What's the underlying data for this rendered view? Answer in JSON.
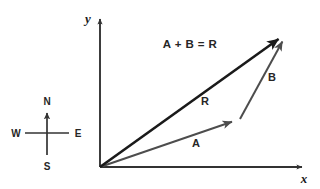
{
  "figure": {
    "background_color": "#ffffff",
    "width": 320,
    "height": 189
  },
  "axes": {
    "x_label": "x",
    "y_label": "y",
    "color": "#333333",
    "origin": {
      "x": 100,
      "y": 167
    },
    "x_end": {
      "x": 305,
      "y": 167
    },
    "y_end": {
      "x": 100,
      "y": 16
    }
  },
  "equation": {
    "text": "A + B = R",
    "x": 190,
    "y": 44
  },
  "vectors": [
    {
      "name": "A",
      "label": "A",
      "color": "#4d4d4d",
      "stroke_width": 2,
      "start": {
        "x": 100,
        "y": 167
      },
      "end": {
        "x": 240,
        "y": 119
      },
      "label_x": 196,
      "label_y": 147
    },
    {
      "name": "B",
      "label": "B",
      "color": "#4d4d4d",
      "stroke_width": 2,
      "start": {
        "x": 240,
        "y": 119
      },
      "end": {
        "x": 287,
        "y": 33
      },
      "label_x": 272,
      "label_y": 81
    },
    {
      "name": "R",
      "label": "R",
      "color": "#1a1a1a",
      "stroke_width": 2.6,
      "start": {
        "x": 100,
        "y": 167
      },
      "end": {
        "x": 287,
        "y": 33
      },
      "label_x": 205,
      "label_y": 105
    }
  ],
  "compass": {
    "center": {
      "x": 47,
      "y": 133
    },
    "arm_length": 25,
    "color": "#333333",
    "north_label": "N",
    "south_label": "S",
    "east_label": "E",
    "west_label": "W"
  }
}
